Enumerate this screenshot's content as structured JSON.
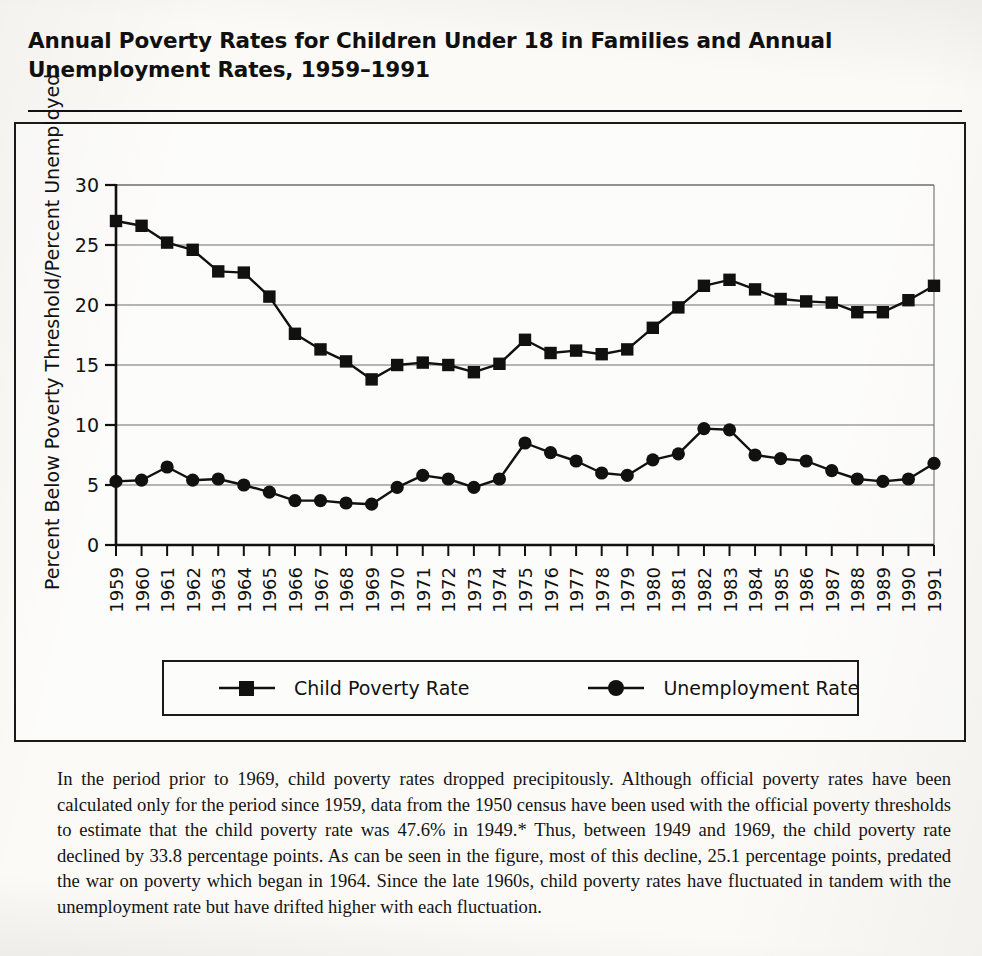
{
  "figure": {
    "title": "Annual Poverty Rates for Children Under 18 in Families and Annual\nUnemployment Rates, 1959–1991",
    "caption": "In the period prior to 1969, child poverty rates dropped precipitously. Although official poverty rates have been calculated only for the period since 1959, data from the 1950 census have been used with the official poverty thresholds to estimate that the child poverty rate was 47.6% in 1949.* Thus, between 1949 and 1969, the child poverty rate declined by 33.8 percentage points. As can be seen in the figure, most of this decline, 25.1 percentage points, predated the war on poverty which began in 1964. Since the late 1960s, child poverty rates have fluctuated in tandem with the unemployment rate but have drifted higher with each fluctuation."
  },
  "legend": {
    "entries": [
      {
        "label": "Child Poverty Rate",
        "marker": "square-marker",
        "color": "#111111"
      },
      {
        "label": "Unemployment Rate",
        "marker": "circle-marker",
        "color": "#111111"
      }
    ]
  },
  "chart_data": {
    "type": "line",
    "title": "Annual Poverty Rates for Children Under 18 in Families and Annual Unemployment Rates, 1959–1991",
    "xlabel": "",
    "ylabel": "Percent Below Poverty Threshold/Percent Unemployed",
    "ylim": [
      0,
      30
    ],
    "yticks": [
      0,
      5,
      10,
      15,
      20,
      25,
      30
    ],
    "grid": "horizontal",
    "legend_position": "bottom",
    "categories": [
      "1959",
      "1960",
      "1961",
      "1962",
      "1963",
      "1964",
      "1965",
      "1966",
      "1967",
      "1968",
      "1969",
      "1970",
      "1971",
      "1972",
      "1973",
      "1974",
      "1975",
      "1976",
      "1977",
      "1978",
      "1979",
      "1980",
      "1981",
      "1982",
      "1983",
      "1984",
      "1985",
      "1986",
      "1987",
      "1988",
      "1989",
      "1990",
      "1991"
    ],
    "series": [
      {
        "name": "Child Poverty Rate",
        "marker": "square-marker",
        "values": [
          27.0,
          26.6,
          25.2,
          24.6,
          22.8,
          22.7,
          20.7,
          17.6,
          16.3,
          15.3,
          13.8,
          15.0,
          15.2,
          15.0,
          14.4,
          15.1,
          17.1,
          16.0,
          16.2,
          15.9,
          16.3,
          18.1,
          19.8,
          21.6,
          22.1,
          21.3,
          20.5,
          20.3,
          20.2,
          19.4,
          19.4,
          20.4,
          21.6
        ]
      },
      {
        "name": "Unemployment Rate",
        "marker": "circle-marker",
        "values": [
          5.3,
          5.4,
          6.5,
          5.4,
          5.5,
          5.0,
          4.4,
          3.7,
          3.7,
          3.5,
          3.4,
          4.8,
          5.8,
          5.5,
          4.8,
          5.5,
          8.5,
          7.7,
          7.0,
          6.0,
          5.8,
          7.1,
          7.6,
          9.7,
          9.6,
          7.5,
          7.2,
          7.0,
          6.2,
          5.5,
          5.3,
          5.5,
          6.8
        ]
      }
    ]
  }
}
